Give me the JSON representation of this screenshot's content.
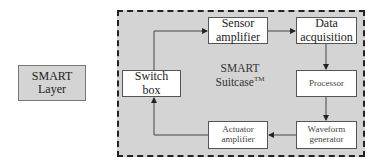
{
  "diagram": {
    "outer_label": {
      "line1": "SMART",
      "line2": "Layer"
    },
    "container": {
      "title_line1": "SMART",
      "title_line2": "Suitcase",
      "trademark": "TM",
      "border_style": "dashed",
      "fill_color": "#d4d4d4"
    },
    "blocks": [
      {
        "id": "switch-box",
        "line1": "Switch",
        "line2": "box"
      },
      {
        "id": "sensor-amplifier",
        "line1": "Sensor",
        "line2": "amplifier"
      },
      {
        "id": "data-acquisition",
        "line1": "Data",
        "line2": "acquisition"
      },
      {
        "id": "processor",
        "line1": "Processor",
        "line2": ""
      },
      {
        "id": "waveform-generator",
        "line1": "Waveform",
        "line2": "generator"
      },
      {
        "id": "actuator-amplifier",
        "line1": "Actuator",
        "line2": "amplifier"
      }
    ],
    "connections": [
      {
        "from": "switch-box",
        "to": "sensor-amplifier"
      },
      {
        "from": "sensor-amplifier",
        "to": "data-acquisition"
      },
      {
        "from": "data-acquisition",
        "to": "processor"
      },
      {
        "from": "processor",
        "to": "waveform-generator"
      },
      {
        "from": "waveform-generator",
        "to": "actuator-amplifier"
      },
      {
        "from": "actuator-amplifier",
        "to": "switch-box"
      }
    ]
  }
}
